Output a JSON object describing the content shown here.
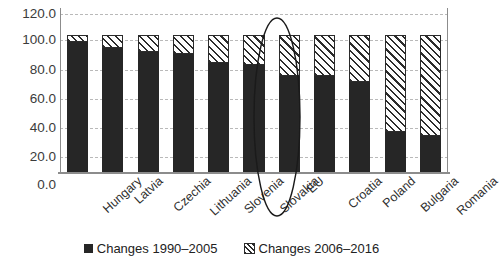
{
  "chart_data": {
    "type": "bar",
    "stacked": true,
    "title": "",
    "subtitle": "",
    "xlabel": "",
    "ylabel": "",
    "ylim": [
      0.0,
      120.0
    ],
    "yticks": [
      "0.0",
      "20.0",
      "40.0",
      "60.0",
      "80.0",
      "100.0",
      "120.0"
    ],
    "ytick_values": [
      0.0,
      20.0,
      40.0,
      60.0,
      80.0,
      100.0,
      120.0
    ],
    "grid": "horizontal-dashed",
    "legend_position": "bottom-center",
    "categories": [
      "Hungary",
      "Latvia",
      "Czechia",
      "Lithuania",
      "Slovenia",
      "Slovakia",
      "EU",
      "Croatia",
      "Poland",
      "Bulgaria",
      "Romania"
    ],
    "series": [
      {
        "name": "Changes 1990–2005",
        "style": "solid-black",
        "color": "#262626",
        "values": [
          95,
          91,
          88,
          86,
          80,
          78,
          70,
          70,
          66,
          29,
          26
        ]
      },
      {
        "name": "Changes 2006–2016",
        "style": "diagonal-hatch",
        "color": "#2b2b2b",
        "values": [
          5,
          9,
          12,
          14,
          20,
          22,
          30,
          30,
          34,
          71,
          74
        ]
      }
    ],
    "totals": [
      100,
      100,
      100,
      100,
      100,
      100,
      100,
      100,
      100,
      100,
      100
    ],
    "annotations": [
      {
        "kind": "ellipse-highlight",
        "target_category": "EU",
        "label": "EU"
      }
    ]
  },
  "legend": {
    "entries": [
      {
        "label": "Changes 1990–2005",
        "swatch": "solid-square-black"
      },
      {
        "label": "Changes 2006–2016",
        "swatch": "hatched-square"
      }
    ]
  },
  "colors": {
    "series_early": "#262626",
    "series_late_line": "#2b2b2b",
    "series_late_fill": "#fdfdfd",
    "gridline": "#b9b9b9",
    "axis": "#8c8c8c",
    "tick_text": "#3b3b3b",
    "background": "#ffffff"
  }
}
